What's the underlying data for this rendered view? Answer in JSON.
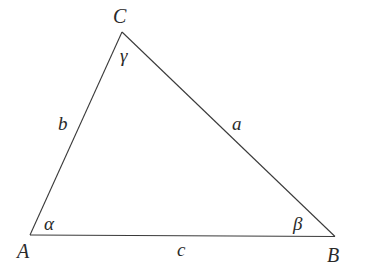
{
  "diagram": {
    "type": "triangle",
    "vertices": [
      {
        "id": "A",
        "label": "A"
      },
      {
        "id": "B",
        "label": "B"
      },
      {
        "id": "C",
        "label": "C"
      }
    ],
    "sides": [
      {
        "id": "a",
        "label": "a",
        "between": [
          "B",
          "C"
        ]
      },
      {
        "id": "b",
        "label": "b",
        "between": [
          "A",
          "C"
        ]
      },
      {
        "id": "c",
        "label": "c",
        "between": [
          "A",
          "B"
        ]
      }
    ],
    "angles": [
      {
        "id": "alpha",
        "label": "α",
        "at": "A"
      },
      {
        "id": "beta",
        "label": "β",
        "at": "B"
      },
      {
        "id": "gamma",
        "label": "γ",
        "at": "C"
      }
    ]
  }
}
